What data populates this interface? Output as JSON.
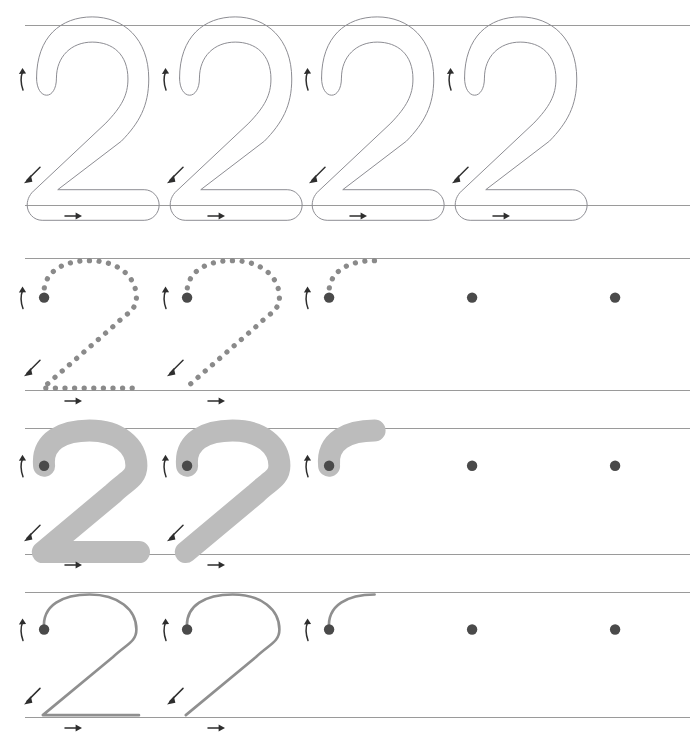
{
  "worksheet": {
    "title": "Number 2 Tracing Practice",
    "character": "2",
    "width": 696,
    "height": 733,
    "background_color": "#ffffff"
  },
  "colors": {
    "rule_line": "#9a9a9a",
    "outline_stroke": "#8d8d93",
    "solid_fill": "#bcbcbc",
    "dotted_stroke": "#8a8a8a",
    "thin_stroke": "#8f8f8f",
    "start_dot": "#4a4a4a",
    "arrow": "#2e2e2e"
  },
  "geometry": {
    "columns_x": [
      35,
      178,
      320,
      463,
      606
    ],
    "column_spacing": 143,
    "line_left": 25,
    "line_right": 690,
    "glyph_width": 130,
    "rows": [
      {
        "top_y": 25,
        "base_y": 205
      },
      {
        "top_y": 258,
        "base_y": 390
      },
      {
        "top_y": 428,
        "base_y": 554
      },
      {
        "top_y": 592,
        "base_y": 717
      }
    ]
  },
  "arrows": {
    "start_up": {
      "name": "up-arrow",
      "symbol": "↑",
      "meaning": "begin stroke moving up"
    },
    "diagonal_down": {
      "name": "down-left-arrow",
      "symbol": "↙",
      "meaning": "draw diagonal down to the left"
    },
    "base_right": {
      "name": "right-arrow",
      "symbol": "→",
      "meaning": "finish with horizontal stroke to the right"
    }
  },
  "rows": [
    {
      "index": 1,
      "style": "outline",
      "label": "Outlined model numerals",
      "glyph_height": 180,
      "stroke_width": 44,
      "items": [
        {
          "index": 1,
          "completion": "full",
          "show_start_dot": false,
          "arrows": [
            "start_up",
            "diagonal_down",
            "base_right"
          ]
        },
        {
          "index": 2,
          "completion": "full",
          "show_start_dot": false,
          "arrows": [
            "start_up",
            "diagonal_down",
            "base_right"
          ]
        },
        {
          "index": 3,
          "completion": "full",
          "show_start_dot": false,
          "arrows": [
            "start_up",
            "diagonal_down",
            "base_right"
          ]
        },
        {
          "index": 4,
          "completion": "full",
          "show_start_dot": false,
          "arrows": [
            "start_up",
            "diagonal_down",
            "base_right"
          ]
        }
      ]
    },
    {
      "index": 2,
      "style": "dotted",
      "label": "Dotted tracing guides",
      "glyph_height": 132,
      "items": [
        {
          "index": 1,
          "completion": "full",
          "show_start_dot": true,
          "arrows": [
            "start_up",
            "diagonal_down",
            "base_right"
          ]
        },
        {
          "index": 2,
          "completion": "partial",
          "show_start_dot": true,
          "arrows": [
            "start_up",
            "diagonal_down",
            "base_right"
          ]
        },
        {
          "index": 3,
          "completion": "hint",
          "show_start_dot": true,
          "arrows": [
            "start_up"
          ]
        },
        {
          "index": 4,
          "completion": "blank",
          "show_start_dot": true,
          "arrows": []
        },
        {
          "index": 5,
          "completion": "blank",
          "show_start_dot": true,
          "arrows": []
        }
      ]
    },
    {
      "index": 3,
      "style": "solid",
      "label": "Solid grey tracing guides",
      "glyph_height": 126,
      "items": [
        {
          "index": 1,
          "completion": "full",
          "show_start_dot": true,
          "arrows": [
            "start_up",
            "diagonal_down",
            "base_right"
          ]
        },
        {
          "index": 2,
          "completion": "partial",
          "show_start_dot": true,
          "arrows": [
            "start_up",
            "diagonal_down",
            "base_right"
          ]
        },
        {
          "index": 3,
          "completion": "hint",
          "show_start_dot": true,
          "arrows": [
            "start_up"
          ]
        },
        {
          "index": 4,
          "completion": "blank",
          "show_start_dot": true,
          "arrows": []
        },
        {
          "index": 5,
          "completion": "blank",
          "show_start_dot": true,
          "arrows": []
        }
      ]
    },
    {
      "index": 4,
      "style": "thin",
      "label": "Thin line tracing guides",
      "glyph_height": 125,
      "items": [
        {
          "index": 1,
          "completion": "full",
          "show_start_dot": true,
          "arrows": [
            "start_up",
            "diagonal_down",
            "base_right"
          ]
        },
        {
          "index": 2,
          "completion": "partial",
          "show_start_dot": true,
          "arrows": [
            "start_up",
            "diagonal_down",
            "base_right"
          ]
        },
        {
          "index": 3,
          "completion": "hint",
          "show_start_dot": true,
          "arrows": [
            "start_up"
          ]
        },
        {
          "index": 4,
          "completion": "blank",
          "show_start_dot": true,
          "arrows": []
        },
        {
          "index": 5,
          "completion": "blank",
          "show_start_dot": true,
          "arrows": []
        }
      ]
    }
  ]
}
